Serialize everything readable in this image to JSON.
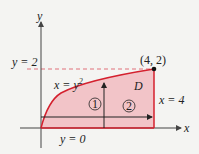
{
  "figure": {
    "axes": {
      "x_label": "x",
      "y_label": "y"
    },
    "region_label": "D",
    "curve_label_x": "x = y",
    "curve_label_exp": "2",
    "line_x4_label": "x = 4",
    "line_y0_label": "y = 0",
    "line_y2_label": "y = 2",
    "point_label": "(4, 2)",
    "order_marks": [
      "1",
      "2"
    ],
    "colors": {
      "region_fill": "#f2c4c8",
      "boundary": "#d4202e",
      "dashed": "#e0707a",
      "axis": "#444444"
    }
  }
}
